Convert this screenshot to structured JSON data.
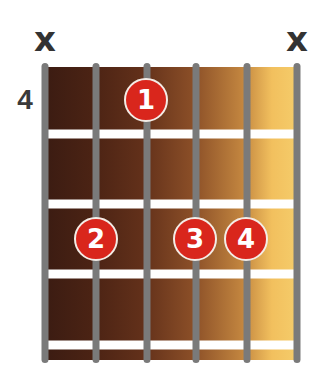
{
  "diagram": {
    "type": "guitar-chord-diagram",
    "start_fret_label": "4",
    "strings": [
      "E",
      "A",
      "D",
      "G",
      "B",
      "e"
    ],
    "mutes": [
      {
        "string_index": 0,
        "symbol": "x"
      },
      {
        "string_index": 5,
        "symbol": "x"
      }
    ],
    "fingers": [
      {
        "finger": "1",
        "string_index": 2,
        "fret": 4
      },
      {
        "finger": "2",
        "string_index": 1,
        "fret": 6
      },
      {
        "finger": "3",
        "string_index": 3,
        "fret": 6
      },
      {
        "finger": "4",
        "string_index": 4,
        "fret": 6
      }
    ],
    "colors": {
      "dot_fill": "#d9261c",
      "dot_border": "#f4ece6",
      "string": "#7a7a7a",
      "fret": "#ffffff",
      "board_dark": "#3c1c12",
      "board_light": "#f5cc6a",
      "mute": "#333333"
    }
  }
}
